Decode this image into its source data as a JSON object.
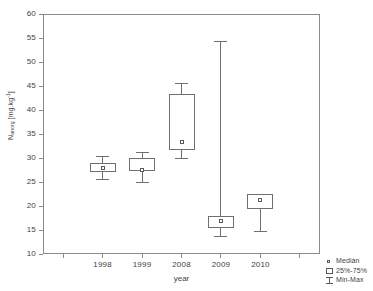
{
  "chart_data": {
    "type": "box",
    "title": "",
    "xlabel": "year",
    "ylabel_main": "N",
    "ylabel_sub": "anorg",
    "ylabel_units_open": " [mg.kg",
    "ylabel_sup": "-1",
    "ylabel_units_close": "]",
    "ylabel_plain": "Nanorg [mg.kg-1]",
    "categories": [
      "1998",
      "1999",
      "2008",
      "2009",
      "2010"
    ],
    "ylim": [
      10,
      60
    ],
    "y_ticks": [
      10,
      15,
      20,
      25,
      30,
      35,
      40,
      45,
      50,
      55,
      60
    ],
    "y_tick_labels": [
      "10",
      "15",
      "20",
      "25",
      "30",
      "35",
      "40",
      "45",
      "50",
      "55",
      "60"
    ],
    "grid": false,
    "legend_position": "bottom-right",
    "series": [
      {
        "name": "1998",
        "min": 25.7,
        "q1": 27.0,
        "median": 27.9,
        "q3": 29.0,
        "max": 30.5
      },
      {
        "name": "1999",
        "min": 25.0,
        "q1": 27.2,
        "median": 27.6,
        "q3": 30.0,
        "max": 31.3
      },
      {
        "name": "2008",
        "min": 30.0,
        "q1": 31.7,
        "median": 33.3,
        "q3": 43.3,
        "max": 45.7
      },
      {
        "name": "2009",
        "min": 13.8,
        "q1": 15.5,
        "median": 16.8,
        "q3": 18.0,
        "max": 54.4
      },
      {
        "name": "2010",
        "min": 14.8,
        "q1": 19.4,
        "median": 21.2,
        "q3": 22.5,
        "max": 22.5
      }
    ],
    "legend": [
      {
        "symbol": "median-marker",
        "label": "Medián"
      },
      {
        "symbol": "box-25-75",
        "label": "25%-75%"
      },
      {
        "symbol": "whisker-minmax",
        "label": "Min-Max"
      }
    ]
  }
}
